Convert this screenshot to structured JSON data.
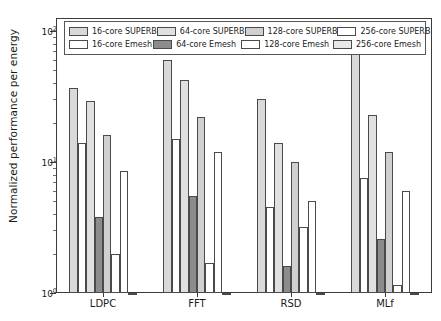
{
  "chart_data": {
    "type": "bar",
    "title": "",
    "subtitle": "",
    "xlabel": "",
    "ylabel": "Normalized performance per energy",
    "yscale": "log",
    "ylim": [
      1,
      100
    ],
    "ytick_labels": [
      "10^0",
      "10^1",
      "10^2"
    ],
    "ytick_values": [
      1,
      10,
      100
    ],
    "grid": false,
    "legend_position": "upper center",
    "categories": [
      "LDPC",
      "FFT",
      "RSD",
      "MLf"
    ],
    "series": [
      {
        "name": "16-core SUPERB",
        "color": "#d9d9d9",
        "values": [
          37,
          60,
          30,
          75
        ]
      },
      {
        "name": "16-core Emesh",
        "color": "#ffffff",
        "values": [
          14,
          15,
          4.5,
          7.5
        ]
      },
      {
        "name": "64-core SUPERB",
        "color": "#e0e0e0",
        "values": [
          29,
          42,
          14,
          23
        ]
      },
      {
        "name": "64-core Emesh",
        "color": "#8c8c8c",
        "values": [
          3.8,
          5.5,
          1.6,
          2.6
        ]
      },
      {
        "name": "128-core SUPERB",
        "color": "#d0d0d0",
        "values": [
          16,
          22,
          10,
          12
        ]
      },
      {
        "name": "128-core Emesh",
        "color": "#ffffff",
        "values": [
          2.0,
          1.7,
          3.2,
          1.15
        ]
      },
      {
        "name": "256-core SUPERB",
        "color": "#ffffff",
        "values": [
          8.5,
          12,
          5.0,
          6.0
        ]
      },
      {
        "name": "256-core Emesh",
        "color": "#ffffff",
        "values": [
          1.0,
          1.0,
          1.0,
          1.0
        ]
      }
    ]
  },
  "legend": {
    "entries": [
      {
        "label": "16-core SUPERB",
        "color": "#d9d9d9"
      },
      {
        "label": "64-core SUPERB",
        "color": "#e0e0e0"
      },
      {
        "label": "128-core SUPERB",
        "color": "#d0d0d0"
      },
      {
        "label": "256-core SUPERB",
        "color": "#ffffff"
      },
      {
        "label": "16-core Emesh",
        "color": "#ffffff"
      },
      {
        "label": "64-core Emesh",
        "color": "#8c8c8c"
      },
      {
        "label": "128-core Emesh",
        "color": "#ffffff"
      },
      {
        "label": "256-core Emesh",
        "color": "#e8e8e8"
      }
    ]
  },
  "axes": {
    "y_label": "Normalized performance per energy",
    "y_ticks": [
      {
        "label_base": "10",
        "label_exp": "2",
        "value": 100
      },
      {
        "label_base": "10",
        "label_exp": "1",
        "value": 10
      },
      {
        "label_base": "10",
        "label_exp": "0",
        "value": 1
      }
    ],
    "x_ticks": [
      "LDPC",
      "FFT",
      "RSD",
      "MLf"
    ]
  }
}
